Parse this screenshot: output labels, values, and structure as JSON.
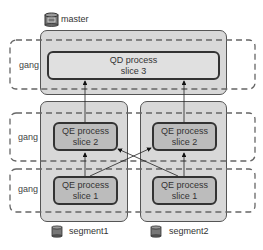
{
  "master": {
    "label": "master",
    "icon": "database-icon",
    "process": {
      "line1": "QD process",
      "line2": "slice 3"
    }
  },
  "segments": [
    {
      "label": "segment1",
      "icon": "database-icon",
      "slice2": {
        "line1": "QE process",
        "line2": "slice 2"
      },
      "slice1": {
        "line1": "QE process",
        "line2": "slice 1"
      }
    },
    {
      "label": "segment2",
      "icon": "database-icon",
      "slice2": {
        "line1": "QE process",
        "line2": "slice 2"
      },
      "slice1": {
        "line1": "QE process",
        "line2": "slice 1"
      }
    }
  ],
  "gangs": [
    {
      "label": "gang"
    },
    {
      "label": "gang"
    },
    {
      "label": "gang"
    }
  ],
  "colors": {
    "outer_fill": "#d8d8d8",
    "qd_fill": "#e0e0e0",
    "qe_fill": "#bcbcbc",
    "border": "#333333",
    "dashed": "#666666"
  }
}
